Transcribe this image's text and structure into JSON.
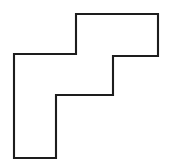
{
  "figure": {
    "name": "staircase-polygon",
    "shape_type": "rectilinear-polygon",
    "fill_color": "#ffffff",
    "stroke_color": "#1d1d1d",
    "stroke_width": 2.1,
    "background_color": "#ffffff",
    "canvas": {
      "width": 173,
      "height": 163
    },
    "vertices": [
      [
        76,
        14
      ],
      [
        158,
        14
      ],
      [
        158,
        56
      ],
      [
        113,
        56
      ],
      [
        113,
        95
      ],
      [
        56,
        95
      ],
      [
        56,
        158
      ],
      [
        14,
        158
      ],
      [
        14,
        54
      ],
      [
        76,
        54
      ]
    ],
    "points_attr": "76,14 158,14 158,56 113,56 113,95 56,95 56,158 14,158 14,54 76,54",
    "edge_count": 10,
    "labels": [],
    "annotations": []
  }
}
